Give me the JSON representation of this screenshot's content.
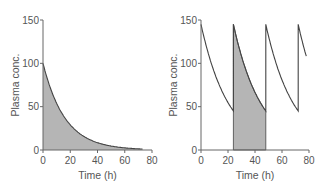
{
  "chart_data": [
    {
      "type": "area",
      "title": "Single dose",
      "xlabel": "Time (h)",
      "ylabel": "Plasma conc.",
      "xlim": [
        0,
        80
      ],
      "ylim": [
        0,
        150
      ],
      "xticks": [
        0,
        20,
        40,
        60,
        80
      ],
      "yticks": [
        0,
        50,
        100,
        150
      ],
      "grid": false,
      "series": [
        {
          "name": "Plasma concentration (exponential decay)",
          "x": [
            0,
            5,
            10,
            15,
            20,
            25,
            30,
            35,
            40,
            45,
            50,
            55,
            60,
            65,
            70,
            73
          ],
          "values": [
            100,
            73,
            54,
            40,
            29,
            21,
            16,
            12,
            8.5,
            6.2,
            4.6,
            3.4,
            2.5,
            1.8,
            1.3,
            1.1
          ],
          "shaded_area": [
            0,
            73
          ]
        }
      ]
    },
    {
      "type": "line",
      "title": "Repeated dosing every 24 h",
      "xlabel": "Time (h)",
      "ylabel": "Plasma conc.",
      "xlim": [
        0,
        80
      ],
      "ylim": [
        0,
        150
      ],
      "xticks": [
        0,
        20,
        40,
        60,
        80
      ],
      "yticks": [
        0,
        50,
        100,
        150
      ],
      "grid": false,
      "series": [
        {
          "name": "Plasma concentration (steady state)",
          "x": [
            0,
            6,
            12,
            18,
            24,
            24,
            30,
            36,
            42,
            48,
            48,
            54,
            60,
            66,
            72,
            72,
            78
          ],
          "values": [
            145,
            110,
            84,
            64,
            48,
            145,
            110,
            84,
            64,
            48,
            145,
            110,
            84,
            64,
            48,
            145,
            110
          ],
          "shaded_area": [
            24,
            48
          ]
        }
      ],
      "dosing_interval_h": 24,
      "peak": 145,
      "trough": 45
    }
  ]
}
